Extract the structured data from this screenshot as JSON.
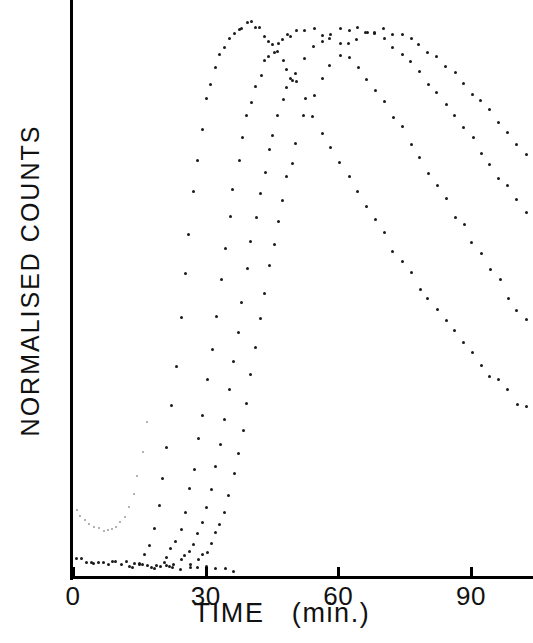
{
  "chart_data": {
    "type": "scatter",
    "title": "",
    "xlabel": "TIME   (min.)",
    "ylabel": "NORMALISED  COUNTS",
    "xlim": [
      0,
      104
    ],
    "ylim": [
      0,
      1.08
    ],
    "grid": false,
    "legend": null,
    "xticks": [
      0,
      30,
      60,
      90
    ],
    "xticklabels": [
      "0",
      "30",
      "60",
      "90"
    ],
    "yticks": [],
    "yticklabels": [],
    "series": [
      {
        "name": "curve-1",
        "comment": "earliest onset, peaks near t=40 min",
        "x": [
          13,
          15,
          16,
          17,
          18,
          19,
          20,
          21,
          22,
          23,
          24,
          25,
          26,
          27,
          28,
          29,
          30,
          31,
          32,
          33,
          34,
          35,
          36,
          37,
          38,
          39,
          40,
          41,
          42,
          43,
          44,
          45,
          46,
          47,
          48,
          49,
          50,
          52,
          54,
          56,
          58,
          60,
          62,
          64,
          66,
          68,
          70,
          72,
          74,
          76,
          78,
          80,
          82,
          84,
          86,
          88,
          90,
          92,
          94,
          96,
          98,
          100,
          102
        ],
        "y": [
          0.01,
          0.02,
          0.03,
          0.05,
          0.08,
          0.12,
          0.17,
          0.23,
          0.3,
          0.38,
          0.46,
          0.54,
          0.62,
          0.69,
          0.75,
          0.81,
          0.86,
          0.89,
          0.92,
          0.94,
          0.96,
          0.97,
          0.98,
          0.99,
          0.99,
          1.0,
          1.0,
          0.99,
          0.99,
          0.98,
          0.97,
          0.96,
          0.95,
          0.93,
          0.92,
          0.9,
          0.89,
          0.86,
          0.83,
          0.8,
          0.77,
          0.75,
          0.72,
          0.69,
          0.67,
          0.64,
          0.62,
          0.59,
          0.57,
          0.55,
          0.52,
          0.5,
          0.48,
          0.46,
          0.44,
          0.42,
          0.4,
          0.38,
          0.36,
          0.35,
          0.33,
          0.31,
          0.3
        ]
      },
      {
        "name": "curve-2",
        "comment": "second onset, peaks near t=55 min",
        "x": [
          18,
          20,
          21,
          22,
          23,
          24,
          25,
          26,
          27,
          28,
          29,
          30,
          31,
          32,
          33,
          34,
          35,
          36,
          37,
          38,
          39,
          40,
          41,
          42,
          43,
          44,
          45,
          46,
          47,
          48,
          49,
          50,
          52,
          54,
          56,
          58,
          60,
          62,
          64,
          66,
          68,
          70,
          72,
          74,
          76,
          78,
          80,
          82,
          84,
          86,
          88,
          90,
          92,
          94,
          96,
          98,
          100,
          102
        ],
        "y": [
          0.01,
          0.02,
          0.03,
          0.04,
          0.06,
          0.08,
          0.11,
          0.15,
          0.19,
          0.24,
          0.29,
          0.35,
          0.41,
          0.47,
          0.53,
          0.59,
          0.65,
          0.7,
          0.75,
          0.79,
          0.83,
          0.86,
          0.89,
          0.91,
          0.93,
          0.94,
          0.95,
          0.96,
          0.97,
          0.98,
          0.98,
          0.99,
          0.99,
          0.99,
          0.98,
          0.97,
          0.96,
          0.94,
          0.92,
          0.9,
          0.88,
          0.86,
          0.83,
          0.81,
          0.78,
          0.76,
          0.73,
          0.7,
          0.68,
          0.65,
          0.63,
          0.6,
          0.58,
          0.55,
          0.53,
          0.5,
          0.48,
          0.46
        ]
      },
      {
        "name": "curve-3",
        "comment": "third onset, broad plateau from t=60 to t=80",
        "x": [
          22,
          24,
          25,
          26,
          27,
          28,
          29,
          30,
          31,
          32,
          33,
          34,
          35,
          36,
          37,
          38,
          39,
          40,
          41,
          42,
          43,
          44,
          45,
          46,
          47,
          48,
          49,
          50,
          52,
          54,
          56,
          58,
          60,
          62,
          64,
          66,
          68,
          70,
          72,
          74,
          76,
          78,
          80,
          82,
          84,
          86,
          88,
          90,
          92,
          94,
          96,
          98,
          100,
          102
        ],
        "y": [
          0.01,
          0.02,
          0.03,
          0.04,
          0.05,
          0.07,
          0.09,
          0.12,
          0.15,
          0.19,
          0.23,
          0.28,
          0.33,
          0.38,
          0.44,
          0.49,
          0.55,
          0.6,
          0.65,
          0.69,
          0.73,
          0.77,
          0.8,
          0.83,
          0.86,
          0.88,
          0.9,
          0.91,
          0.94,
          0.96,
          0.97,
          0.98,
          0.99,
          0.99,
          0.99,
          0.98,
          0.98,
          0.97,
          0.96,
          0.94,
          0.93,
          0.91,
          0.89,
          0.87,
          0.85,
          0.83,
          0.81,
          0.79,
          0.76,
          0.74,
          0.72,
          0.7,
          0.68,
          0.66
        ]
      },
      {
        "name": "curve-4",
        "comment": "latest onset, slowest washout, highest at right edge",
        "x": [
          26,
          28,
          29,
          30,
          31,
          32,
          33,
          34,
          35,
          36,
          37,
          38,
          39,
          40,
          41,
          42,
          43,
          44,
          45,
          46,
          47,
          48,
          49,
          50,
          52,
          54,
          56,
          58,
          60,
          62,
          64,
          66,
          68,
          70,
          72,
          74,
          76,
          78,
          80,
          82,
          84,
          86,
          88,
          90,
          92,
          94,
          96,
          98,
          100,
          102
        ],
        "y": [
          0.01,
          0.02,
          0.03,
          0.04,
          0.05,
          0.07,
          0.09,
          0.11,
          0.14,
          0.18,
          0.22,
          0.26,
          0.31,
          0.36,
          0.41,
          0.46,
          0.51,
          0.56,
          0.6,
          0.64,
          0.68,
          0.72,
          0.75,
          0.78,
          0.83,
          0.87,
          0.9,
          0.92,
          0.94,
          0.96,
          0.97,
          0.98,
          0.98,
          0.99,
          0.98,
          0.98,
          0.97,
          0.96,
          0.95,
          0.94,
          0.92,
          0.91,
          0.89,
          0.87,
          0.86,
          0.84,
          0.82,
          0.8,
          0.78,
          0.76
        ]
      },
      {
        "name": "baseline",
        "comment": "flat near-zero series hugging the x-axis from t=0 to t=20",
        "x": [
          0.5,
          1.5,
          2.5,
          3.5,
          4.5,
          5.5,
          6.5,
          7.5,
          8.5,
          9.5,
          10.5,
          11.5,
          12.5,
          13.5,
          14.5,
          15.5,
          16.5,
          17.5,
          18.5,
          19.5,
          20.5,
          21.5,
          22.5,
          24,
          26,
          28,
          30,
          32,
          34,
          36
        ],
        "y": [
          0.022,
          0.022,
          0.021,
          0.021,
          0.02,
          0.02,
          0.019,
          0.018,
          0.018,
          0.017,
          0.016,
          0.016,
          0.015,
          0.014,
          0.014,
          0.013,
          0.013,
          0.012,
          0.012,
          0.011,
          0.011,
          0.01,
          0.01,
          0.009,
          0.009,
          0.008,
          0.008,
          0.007,
          0.007,
          0.006
        ]
      },
      {
        "name": "dip-curve",
        "comment": "shallow U-shaped series near the origin, minimum around t=7 min",
        "x": [
          0.5,
          1.5,
          2.5,
          3.5,
          4.5,
          5.5,
          6.5,
          7.5,
          8.5,
          9.5,
          10.5,
          11.5,
          12.5,
          13.5,
          14.5,
          15.5,
          16.5
        ],
        "y": [
          0.115,
          0.103,
          0.094,
          0.087,
          0.082,
          0.079,
          0.077,
          0.077,
          0.079,
          0.083,
          0.09,
          0.101,
          0.118,
          0.142,
          0.175,
          0.219,
          0.275
        ]
      }
    ]
  },
  "axes": {
    "y_label": "NORMALISED  COUNTS",
    "x_label": "TIME   (min.)",
    "tick_labels": [
      "0",
      "30",
      "60",
      "90"
    ]
  }
}
